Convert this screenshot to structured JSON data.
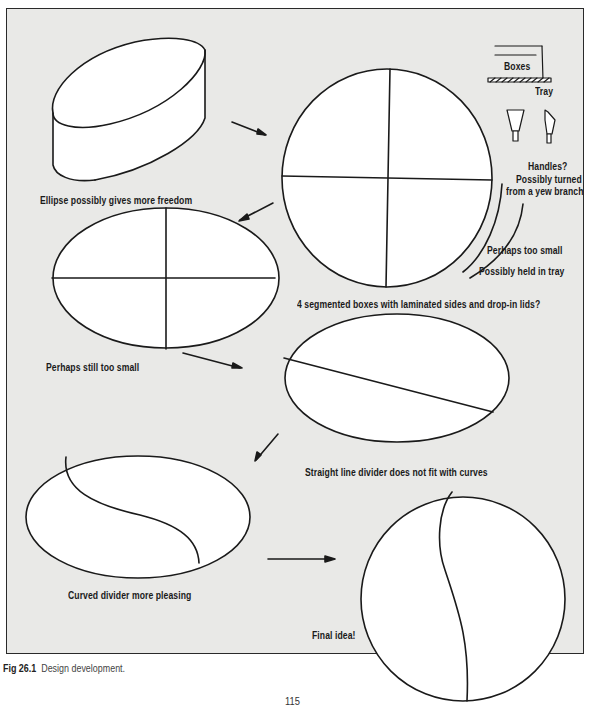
{
  "figure": {
    "background_color": "#e9e9e7",
    "line_color": "#1a1a1a",
    "labels": {
      "ellipse_freedom": "Ellipse possibly gives more freedom",
      "boxes": "Boxes",
      "tray": "Tray",
      "handles_line1": "Handles?",
      "handles_line2": "Possibly turned",
      "handles_line3": "from a yew branch",
      "too_small": "Perhaps too small",
      "held_in_tray": "Possibly held in tray",
      "segmented": "4 segmented boxes with laminated sides and drop-in lids?",
      "still_too_small": "Perhaps still too small",
      "straight_divider": "Straight line divider does not fit with curves",
      "curved_divider": "Curved divider more pleasing",
      "final_idea": "Final idea!"
    },
    "sketches": [
      {
        "id": "oval-box-3d",
        "shape": "ellipse-cylinder"
      },
      {
        "id": "circle-quartered",
        "shape": "circle",
        "divider": "cross"
      },
      {
        "id": "ellipse-quartered",
        "shape": "ellipse",
        "divider": "cross"
      },
      {
        "id": "ellipse-straight",
        "shape": "ellipse",
        "divider": "diagonal-line"
      },
      {
        "id": "ellipse-curved",
        "shape": "ellipse",
        "divider": "s-curve"
      },
      {
        "id": "circle-final",
        "shape": "circle",
        "divider": "s-curve"
      }
    ]
  },
  "caption": {
    "number": "Fig 26.1",
    "text": "Design development."
  },
  "page_number": "115"
}
